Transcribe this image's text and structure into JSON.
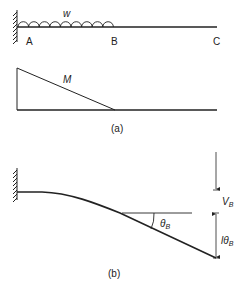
{
  "figure_a": {
    "caption": "(a)",
    "beam": {
      "load_label": "w",
      "point_labels": [
        "A",
        "B",
        "C"
      ]
    },
    "moment_diagram": {
      "label": "M"
    }
  },
  "figure_b": {
    "caption": "(b)",
    "angle_label": "θ",
    "angle_sub": "B",
    "deflection_label": "V",
    "deflection_sub": "B",
    "rotation_deflection_label": "lθ",
    "rotation_deflection_sub": "B"
  },
  "colors": {
    "line": "#222222",
    "background": "#ffffff"
  }
}
